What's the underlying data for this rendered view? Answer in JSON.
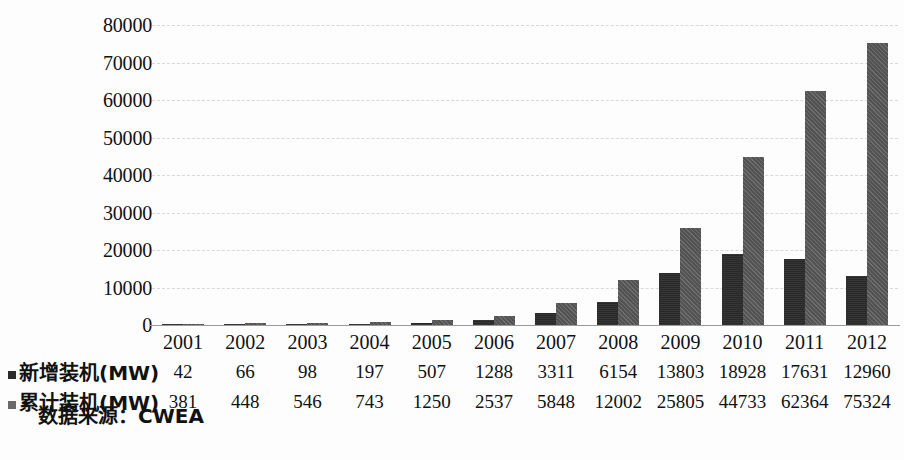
{
  "chart_data": {
    "type": "bar",
    "title": "",
    "subtitle": "",
    "xlabel": "",
    "ylabel": "",
    "categories": [
      "2001",
      "2002",
      "2003",
      "2004",
      "2005",
      "2006",
      "2007",
      "2008",
      "2009",
      "2010",
      "2011",
      "2012"
    ],
    "series": [
      {
        "name": "新增装机(MW)",
        "color": "#2b2b2b",
        "values": [
          42,
          66,
          98,
          197,
          507,
          1288,
          3311,
          6154,
          13803,
          18928,
          17631,
          12960
        ]
      },
      {
        "name": "累计装机(MW)",
        "color": "#5c5c5c",
        "values": [
          381,
          448,
          546,
          743,
          1250,
          2537,
          5848,
          12002,
          25805,
          44733,
          62364,
          75324
        ]
      }
    ],
    "ylim": [
      0,
      80000
    ],
    "yticks": [
      "0",
      "10000",
      "20000",
      "30000",
      "40000",
      "50000",
      "60000",
      "70000",
      "80000"
    ],
    "ytick_values": [
      0,
      10000,
      20000,
      30000,
      40000,
      50000,
      60000,
      70000,
      80000
    ],
    "grid": true,
    "grid_style": "dashed",
    "legend_position": "bottom-left-table"
  },
  "table": {
    "row_labels": [
      "新增装机(MW)",
      "累计装机(MW)"
    ],
    "columns": [
      "2001",
      "2002",
      "2003",
      "2004",
      "2005",
      "2006",
      "2007",
      "2008",
      "2009",
      "2010",
      "2011",
      "2012"
    ],
    "rows": [
      [
        "42",
        "66",
        "98",
        "197",
        "507",
        "1288",
        "3311",
        "6154",
        "13803",
        "18928",
        "17631",
        "12960"
      ],
      [
        "381",
        "448",
        "546",
        "743",
        "1250",
        "2537",
        "5848",
        "12002",
        "25805",
        "44733",
        "62364",
        "75324"
      ]
    ]
  },
  "footer": {
    "source": "数据来源：CWEA"
  }
}
